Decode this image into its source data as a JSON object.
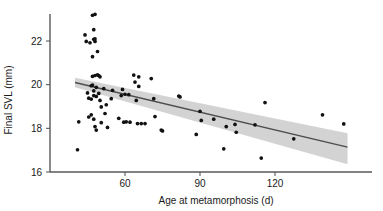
{
  "chart_data": {
    "type": "scatter",
    "title": "",
    "xlabel": "Age at metamorphosis (d)",
    "ylabel": "Final SVL (mm)",
    "xlim": [
      38,
      152
    ],
    "ylim": [
      15.6,
      23.4
    ],
    "xticks": [
      60,
      90,
      120
    ],
    "xtick_labels": [
      "60",
      "90",
      "120"
    ],
    "yticks": [
      16,
      18,
      20,
      22
    ],
    "ytick_labels": [
      "16",
      "18",
      "20",
      "22"
    ],
    "grid": false,
    "legend": null,
    "colors": {
      "points": "#111111",
      "fit_line": "#4d4d4d",
      "ci_band": "#c9c9c9",
      "axis": "#595959",
      "text": "#1a1a1a",
      "background": "#ffffff"
    },
    "points": [
      {
        "x": 41.0,
        "y": 17.02
      },
      {
        "x": 41.5,
        "y": 18.3
      },
      {
        "x": 44.0,
        "y": 22.28
      },
      {
        "x": 44.5,
        "y": 21.98
      },
      {
        "x": 45.0,
        "y": 19.62
      },
      {
        "x": 45.5,
        "y": 19.38
      },
      {
        "x": 45.5,
        "y": 18.52
      },
      {
        "x": 46.0,
        "y": 21.92
      },
      {
        "x": 46.5,
        "y": 19.95
      },
      {
        "x": 46.5,
        "y": 19.34
      },
      {
        "x": 46.5,
        "y": 18.62
      },
      {
        "x": 47.0,
        "y": 23.18
      },
      {
        "x": 47.0,
        "y": 21.28
      },
      {
        "x": 47.0,
        "y": 20.38
      },
      {
        "x": 47.0,
        "y": 19.98
      },
      {
        "x": 47.5,
        "y": 22.52
      },
      {
        "x": 47.5,
        "y": 22.08
      },
      {
        "x": 47.5,
        "y": 19.72
      },
      {
        "x": 47.5,
        "y": 19.5
      },
      {
        "x": 47.5,
        "y": 18.42
      },
      {
        "x": 48.0,
        "y": 23.22
      },
      {
        "x": 48.0,
        "y": 22.1
      },
      {
        "x": 48.0,
        "y": 21.98
      },
      {
        "x": 48.0,
        "y": 20.42
      },
      {
        "x": 48.0,
        "y": 18.08
      },
      {
        "x": 48.5,
        "y": 19.88
      },
      {
        "x": 48.5,
        "y": 19.46
      },
      {
        "x": 48.5,
        "y": 17.92
      },
      {
        "x": 49.0,
        "y": 21.52
      },
      {
        "x": 49.0,
        "y": 20.45
      },
      {
        "x": 49.5,
        "y": 20.42
      },
      {
        "x": 49.5,
        "y": 19.6
      },
      {
        "x": 50.0,
        "y": 20.36
      },
      {
        "x": 50.0,
        "y": 19.28
      },
      {
        "x": 50.5,
        "y": 18.98
      },
      {
        "x": 50.5,
        "y": 18.26
      },
      {
        "x": 51.5,
        "y": 19.82
      },
      {
        "x": 52.0,
        "y": 18.68
      },
      {
        "x": 52.5,
        "y": 19.08
      },
      {
        "x": 53.0,
        "y": 18.04
      },
      {
        "x": 54.5,
        "y": 19.36
      },
      {
        "x": 55.0,
        "y": 19.74
      },
      {
        "x": 57.5,
        "y": 18.46
      },
      {
        "x": 58.5,
        "y": 19.5
      },
      {
        "x": 59.0,
        "y": 19.78
      },
      {
        "x": 59.5,
        "y": 18.28
      },
      {
        "x": 60.0,
        "y": 19.56
      },
      {
        "x": 60.5,
        "y": 18.3
      },
      {
        "x": 61.5,
        "y": 19.54
      },
      {
        "x": 62.0,
        "y": 18.28
      },
      {
        "x": 63.5,
        "y": 20.44
      },
      {
        "x": 64.0,
        "y": 20.12
      },
      {
        "x": 64.5,
        "y": 19.28
      },
      {
        "x": 65.0,
        "y": 18.22
      },
      {
        "x": 65.5,
        "y": 20.36
      },
      {
        "x": 65.5,
        "y": 19.92
      },
      {
        "x": 66.5,
        "y": 18.22
      },
      {
        "x": 68.0,
        "y": 18.22
      },
      {
        "x": 70.5,
        "y": 20.28
      },
      {
        "x": 71.5,
        "y": 19.36
      },
      {
        "x": 72.0,
        "y": 18.54
      },
      {
        "x": 74.5,
        "y": 17.92
      },
      {
        "x": 75.0,
        "y": 17.88
      },
      {
        "x": 81.5,
        "y": 19.48
      },
      {
        "x": 82.0,
        "y": 19.44
      },
      {
        "x": 88.5,
        "y": 17.72
      },
      {
        "x": 90.0,
        "y": 18.78
      },
      {
        "x": 90.5,
        "y": 18.36
      },
      {
        "x": 95.5,
        "y": 18.42
      },
      {
        "x": 99.5,
        "y": 17.06
      },
      {
        "x": 100.5,
        "y": 18.08
      },
      {
        "x": 104.0,
        "y": 18.18
      },
      {
        "x": 104.5,
        "y": 17.82
      },
      {
        "x": 112.0,
        "y": 18.16
      },
      {
        "x": 114.5,
        "y": 16.64
      },
      {
        "x": 116.0,
        "y": 19.18
      },
      {
        "x": 127.5,
        "y": 17.52
      },
      {
        "x": 139.0,
        "y": 18.62
      },
      {
        "x": 147.5,
        "y": 18.2
      }
    ],
    "fit_line": {
      "x_start": 40.0,
      "y_start": 20.1,
      "x_end": 149.0,
      "y_end": 17.14
    },
    "ci_band": {
      "x_start": 40.0,
      "upper_start": 20.32,
      "lower_start": 19.88,
      "x_end": 149.0,
      "upper_end": 17.78,
      "lower_end": 16.36
    }
  }
}
